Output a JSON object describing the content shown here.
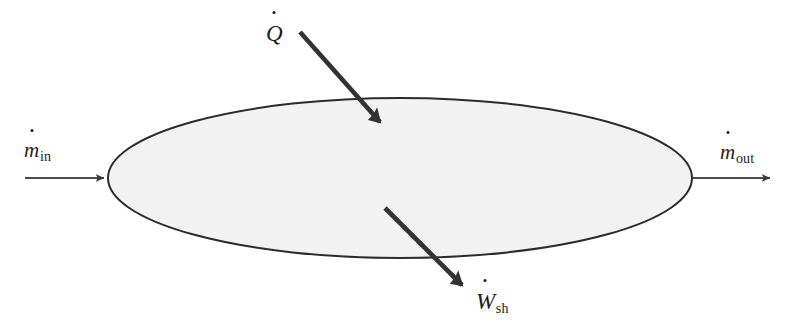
{
  "figure": {
    "name": "control-volume-energy-balance",
    "background_color": "#ffffff"
  },
  "control_volume": {
    "shape": "ellipse",
    "fill_color": "#f2f2f2",
    "stroke_color": "#2b2b2b",
    "center_x": 400,
    "center_y": 178,
    "radius_x": 293,
    "radius_y": 80.5,
    "stroke_width": 2
  },
  "labels": {
    "mass_in": {
      "symbol": "m",
      "subscript": "in",
      "has_overdot": true,
      "text": "ṁin"
    },
    "mass_out": {
      "symbol": "m",
      "subscript": "out",
      "has_overdot": true,
      "text": "ṁout"
    },
    "heat_rate": {
      "symbol": "Q",
      "subscript": "",
      "has_overdot": true,
      "text": "Q̇"
    },
    "shaft_work": {
      "symbol": "W",
      "subscript": "sh",
      "has_overdot": true,
      "text": "Ẇsh"
    }
  },
  "arrows": {
    "inlet": {
      "style": "thin",
      "color": "#4a4a4a",
      "stroke_width": 2,
      "x1": 25,
      "y1": 178,
      "x2": 108,
      "y2": 178,
      "direction": "right",
      "head": "solid-triangle"
    },
    "outlet": {
      "style": "thin",
      "color": "#4a4a4a",
      "stroke_width": 2,
      "x1": 693,
      "y1": 178,
      "x2": 775,
      "y2": 178,
      "direction": "right",
      "head": "solid-triangle"
    },
    "heat": {
      "style": "thick",
      "color": "#333333",
      "stroke_width": 5,
      "x1": 300,
      "y1": 32,
      "x2": 388,
      "y2": 130,
      "direction": "down-right",
      "head": "solid-triangle"
    },
    "work": {
      "style": "thick",
      "color": "#333333",
      "stroke_width": 5,
      "x1": 385,
      "y1": 208,
      "x2": 470,
      "y2": 293,
      "direction": "down-right",
      "head": "solid-triangle"
    }
  }
}
